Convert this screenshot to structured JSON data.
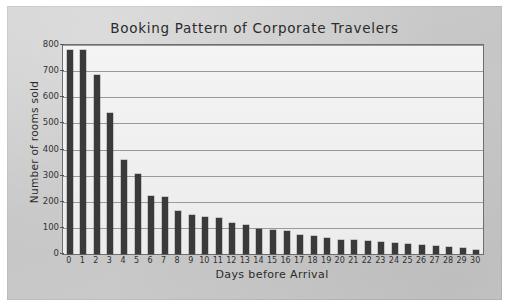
{
  "chart_data": {
    "type": "bar",
    "title": "Booking Pattern of Corporate Travelers",
    "xlabel": "Days before Arrival",
    "ylabel": "Number of rooms sold",
    "categories": [
      "0",
      "1",
      "2",
      "3",
      "4",
      "5",
      "6",
      "7",
      "8",
      "9",
      "10",
      "11",
      "12",
      "13",
      "14",
      "15",
      "16",
      "17",
      "18",
      "19",
      "20",
      "21",
      "22",
      "23",
      "24",
      "25",
      "26",
      "27",
      "28",
      "29",
      "30"
    ],
    "values": [
      780,
      780,
      685,
      540,
      360,
      305,
      222,
      218,
      165,
      150,
      140,
      138,
      118,
      112,
      95,
      92,
      88,
      72,
      68,
      62,
      52,
      52,
      50,
      45,
      42,
      38,
      35,
      30,
      26,
      22,
      16
    ],
    "series": [
      {
        "name": "Number of rooms sold",
        "values": [
          780,
          780,
          685,
          540,
          360,
          305,
          222,
          218,
          165,
          150,
          140,
          138,
          118,
          112,
          95,
          92,
          88,
          72,
          68,
          62,
          52,
          52,
          50,
          45,
          42,
          38,
          35,
          30,
          26,
          22,
          16
        ]
      }
    ],
    "ylim": [
      0,
      800
    ],
    "yticks": [
      0,
      100,
      200,
      300,
      400,
      500,
      600,
      700,
      800
    ],
    "ytick_labels": [
      "0",
      "100",
      "200",
      "300",
      "400",
      "500",
      "600",
      "700",
      "800"
    ],
    "grid": "horizontal",
    "legend": "none",
    "bar_color": "#3a3a3a",
    "plot_background": "#f2f2f2",
    "page_background": "#c9c9c9"
  }
}
